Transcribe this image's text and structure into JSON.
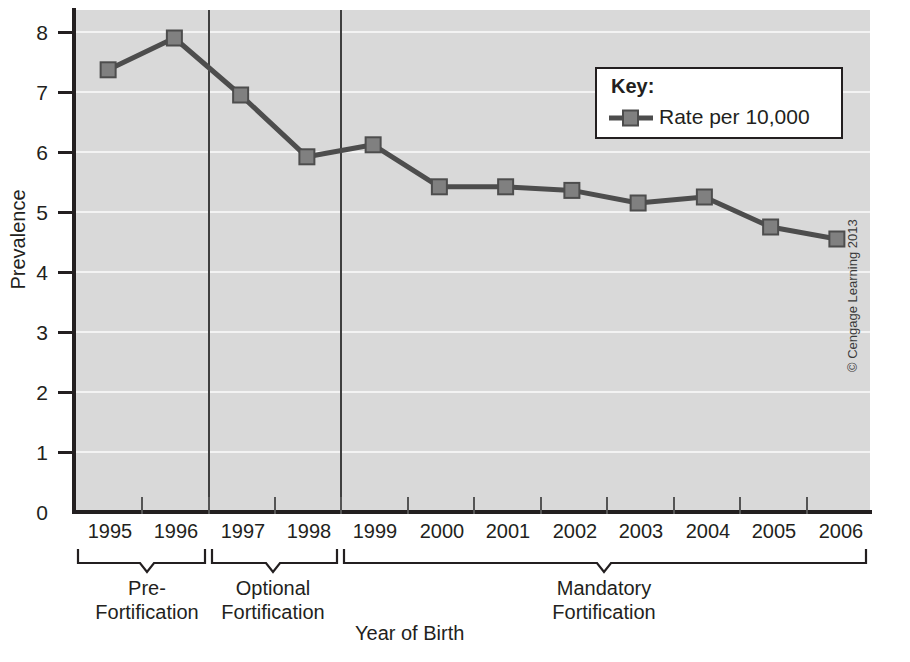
{
  "chart_data": {
    "type": "line",
    "title": "",
    "xlabel": "Year of Birth",
    "ylabel": "Prevalence",
    "categories": [
      "1995",
      "1996",
      "1997",
      "1998",
      "1999",
      "2000",
      "2001",
      "2002",
      "2003",
      "2004",
      "2005",
      "2006"
    ],
    "series": [
      {
        "name": "Rate per 10,000",
        "values": [
          7.37,
          7.9,
          6.95,
          5.92,
          6.12,
          5.42,
          5.42,
          5.36,
          5.15,
          5.25,
          4.75,
          4.55
        ]
      }
    ],
    "ylim": [
      0,
      8
    ],
    "yticks": [
      0,
      1,
      2,
      3,
      4,
      5,
      6,
      7,
      8
    ],
    "ytick_labels": [
      "0",
      "1",
      "2",
      "3",
      "4",
      "5",
      "6",
      "7",
      "8"
    ],
    "grid": true,
    "grid_axis": "y",
    "legend_position": "upper-right",
    "legend_title": "Key:",
    "legend_entries": [
      "Rate per 10,000"
    ],
    "marker": "square",
    "series_color": "#4d4d4d",
    "marker_color": "#808080",
    "plot_background": "#d9d9d9",
    "gridline_color": "#f3f3f3",
    "annotations": [
      {
        "label": "Pre-\nFortification",
        "spans": [
          "1995",
          "1996"
        ]
      },
      {
        "label": "Optional\nFortification",
        "spans": [
          "1997",
          "1998"
        ]
      },
      {
        "label": "Mandatory\nFortification",
        "spans": [
          "1999",
          "2000",
          "2001",
          "2002",
          "2003",
          "2004",
          "2005",
          "2006"
        ]
      }
    ]
  },
  "axes": {
    "y_title": "Prevalence",
    "x_title": "Year of Birth",
    "y_labels": [
      "8",
      "7",
      "6",
      "5",
      "4",
      "3",
      "2",
      "1",
      "0"
    ],
    "x_labels": [
      "1995",
      "1996",
      "1997",
      "1998",
      "1999",
      "2000",
      "2001",
      "2002",
      "2003",
      "2004",
      "2005",
      "2006"
    ]
  },
  "legend": {
    "title": "Key:",
    "entry_label": "Rate per 10,000"
  },
  "brackets": [
    {
      "line1": "Pre-",
      "line2": "Fortification"
    },
    {
      "line1": "Optional",
      "line2": "Fortification"
    },
    {
      "line1": "Mandatory",
      "line2": "Fortification"
    }
  ],
  "credit": {
    "text": "© Cengage Learning 2013"
  }
}
